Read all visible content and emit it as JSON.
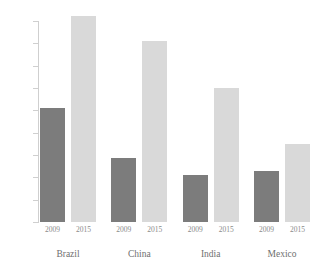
{
  "chart_data": {
    "type": "bar",
    "title": "",
    "subtitle": "",
    "xlabel": "",
    "ylabel": "",
    "categories": [
      "Brazil",
      "China",
      "India",
      "Mexico"
    ],
    "series": [
      {
        "name": "2009",
        "values": [
          10.2,
          5.7,
          4.2,
          4.6
        ],
        "color": "#7c7c7c"
      },
      {
        "name": "2015",
        "values": [
          18.4,
          16.2,
          12.0,
          7.0
        ],
        "color": "#d9d9d9"
      }
    ],
    "ylim": [
      0,
      18.8
    ],
    "yticks": [
      0,
      2,
      4,
      6,
      8,
      10,
      12,
      14,
      16,
      18
    ],
    "ytick_labels": [
      "0",
      "2",
      "4",
      "6",
      "8",
      "10",
      "12",
      "14",
      "16",
      "18"
    ],
    "grid": false,
    "legend": "none",
    "xtick_labels_per_group": [
      "2009",
      "2015"
    ],
    "axis_color": "#cfcfcf",
    "tick_label_color": "#8a8a8a",
    "category_label_color": "#6f6f6f",
    "background": "#ffffff"
  }
}
